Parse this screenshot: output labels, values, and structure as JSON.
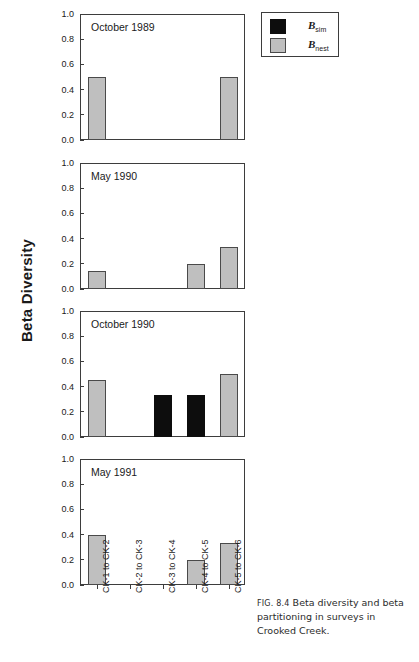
{
  "figure": {
    "y_axis_label": "Beta Diversity",
    "caption_prefix": "FIG. 8.4",
    "caption_text": "Beta diversity and beta partitioning in surveys in Crooked Creek."
  },
  "legend": {
    "items": [
      {
        "name": "B",
        "sub": "sim",
        "color": "#0d0d0d",
        "key": "sim"
      },
      {
        "name": "B",
        "sub": "nest",
        "color": "#bfbfbf",
        "key": "nest"
      }
    ]
  },
  "chart_data": {
    "type": "bar",
    "title": "Beta diversity and beta partitioning in surveys in Crooked Creek",
    "xlabel": "",
    "ylabel": "Beta Diversity",
    "ylim": [
      0.0,
      1.0
    ],
    "yticks": [
      "0.0",
      "0.2",
      "0.4",
      "0.6",
      "0.8",
      "1.0"
    ],
    "grid": false,
    "legend_position": "top-right",
    "categories": [
      "CK-1 to CK-2",
      "CK-2 to CK-3",
      "CK-3 to CK-4",
      "CK-4 to CK-5",
      "CK-5 to CK-6"
    ],
    "panels": [
      {
        "label": "October 1989",
        "series": [
          {
            "name": "Bsim",
            "key": "sim",
            "values": [
              0.0,
              0.0,
              0.0,
              0.0,
              0.0
            ]
          },
          {
            "name": "Bnest",
            "key": "nest",
            "values": [
              0.5,
              0.0,
              0.0,
              0.0,
              0.5
            ]
          }
        ]
      },
      {
        "label": "May 1990",
        "series": [
          {
            "name": "Bsim",
            "key": "sim",
            "values": [
              0.0,
              0.0,
              0.0,
              0.0,
              0.0
            ]
          },
          {
            "name": "Bnest",
            "key": "nest",
            "values": [
              0.14,
              0.0,
              0.0,
              0.2,
              0.33
            ]
          }
        ]
      },
      {
        "label": "October 1990",
        "series": [
          {
            "name": "Bsim",
            "key": "sim",
            "values": [
              0.0,
              0.0,
              0.33,
              0.33,
              0.0
            ]
          },
          {
            "name": "Bnest",
            "key": "nest",
            "values": [
              0.45,
              0.0,
              0.0,
              0.0,
              0.5
            ]
          }
        ]
      },
      {
        "label": "May 1991",
        "series": [
          {
            "name": "Bsim",
            "key": "sim",
            "values": [
              0.0,
              0.0,
              0.0,
              0.0,
              0.0
            ]
          },
          {
            "name": "Bnest",
            "key": "nest",
            "values": [
              0.4,
              0.0,
              0.0,
              0.2,
              0.33
            ]
          }
        ]
      }
    ]
  },
  "layout": {
    "panel_tops": [
      14,
      163,
      311,
      459
    ],
    "panel_height": 126,
    "panel_left": 80,
    "panel_width": 165
  }
}
